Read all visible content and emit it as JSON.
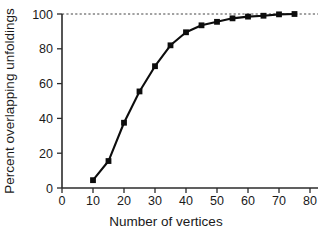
{
  "chart_data": {
    "type": "line",
    "title": "",
    "xlabel": "Number of vertices",
    "ylabel": "Percent overlapping unfoldings",
    "xlim": [
      0,
      80
    ],
    "ylim": [
      0,
      100
    ],
    "xticks": [
      0,
      10,
      20,
      30,
      40,
      50,
      60,
      70,
      80
    ],
    "yticks": [
      0,
      20,
      40,
      60,
      80,
      100
    ],
    "xtick_labels": [
      "0",
      "10",
      "20",
      "30",
      "40",
      "50",
      "60",
      "70",
      "80"
    ],
    "ytick_labels": [
      "0",
      "20",
      "40",
      "60",
      "80",
      "100"
    ],
    "grid": false,
    "legend": false,
    "marker": "square",
    "line_color": "#0d0d0d",
    "marker_color": "#0d0d0d",
    "reference_line": {
      "orientation": "horizontal",
      "value": 100,
      "style": "dashed",
      "color": "#444444"
    },
    "x": [
      10,
      15,
      20,
      25,
      30,
      35,
      40,
      45,
      50,
      55,
      60,
      65,
      70,
      75
    ],
    "y": [
      4.5,
      15.5,
      37.5,
      55.5,
      70,
      82,
      89.5,
      93.5,
      95.5,
      97.5,
      98.5,
      99,
      99.8,
      100
    ],
    "series": [
      {
        "name": "Percent overlapping unfoldings",
        "x": [
          10,
          15,
          20,
          25,
          30,
          35,
          40,
          45,
          50,
          55,
          60,
          65,
          70,
          75
        ],
        "values": [
          4.5,
          15.5,
          37.5,
          55.5,
          70,
          82,
          89.5,
          93.5,
          95.5,
          97.5,
          98.5,
          99,
          99.8,
          100
        ]
      }
    ]
  }
}
